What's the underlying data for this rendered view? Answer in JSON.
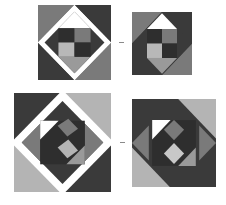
{
  "colors": {
    "dark": "#3a3a3a",
    "darker": "#2e2e2e",
    "medium": "#7a7a7a",
    "light": "#b4b4b4",
    "lighter": "#c8c8c8",
    "white": "#ffffff",
    "dash": "#8a8a8a"
  },
  "figures": [
    {
      "id": "fig1",
      "position": {
        "x": 38,
        "y": 5,
        "w": 73,
        "h": 75
      },
      "description": "Square block: outer corners dark/medium/light, white diamond frame, dark diamond with 2x2 checkerboard center"
    },
    {
      "id": "fig2",
      "position": {
        "x": 132,
        "y": 12,
        "w": 60,
        "h": 63
      },
      "description": "Rotated variant of fig1 with white triangle top and rearranged corner triangles"
    },
    {
      "id": "fig3",
      "position": {
        "x": 14,
        "y": 93,
        "w": 97,
        "h": 99
      },
      "description": "Larger block: white diamond frame, inner square with diagonal checker pieces"
    },
    {
      "id": "fig4",
      "position": {
        "x": 132,
        "y": 99,
        "w": 84,
        "h": 88
      },
      "description": "Rotated/pinwheel variant of fig3"
    }
  ],
  "separators": [
    {
      "symbol": "-",
      "x": 119,
      "y": 42,
      "w": 5
    },
    {
      "symbol": "-",
      "x": 120,
      "y": 142,
      "w": 5
    }
  ]
}
